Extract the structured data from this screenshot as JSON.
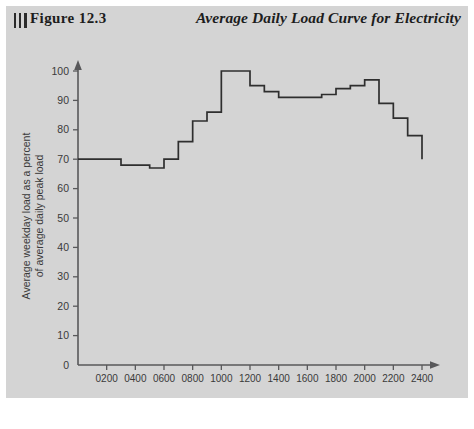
{
  "header": {
    "figure_label": "Figure 12.3",
    "title": "Average Daily Load Curve for Electricity",
    "bar_marks": "|||"
  },
  "colors": {
    "page_background": "#ffffff",
    "panel_background": "#d4d4d4",
    "axis": "#58585a",
    "curve": "#2e2e2e",
    "text": "#1d1d1d",
    "tick_text": "#3a3a3a"
  },
  "chart_data": {
    "type": "line",
    "title": "Average Daily Load Curve for Electricity",
    "subtitle": "",
    "xlabel": "Time of day",
    "ylabel": "Average weekday load as a percent of average daily peak load",
    "ylabel_line1": "Average weekday load as a percent",
    "ylabel_line2": "of average daily peak load",
    "xlim": [
      0,
      2400
    ],
    "ylim": [
      0,
      105
    ],
    "grid": false,
    "legend": "none",
    "step_style": "post",
    "ytick_labels": [
      "0",
      "10",
      "20",
      "30",
      "40",
      "50",
      "60",
      "70",
      "80",
      "90",
      "100"
    ],
    "yticks": [
      0,
      10,
      20,
      30,
      40,
      50,
      60,
      70,
      80,
      90,
      100
    ],
    "xtick_labels": [
      "0200",
      "0400",
      "0600",
      "0800",
      "1000",
      "1200",
      "1400",
      "1600",
      "1800",
      "2000",
      "2200",
      "2400"
    ],
    "xticks": [
      200,
      400,
      600,
      800,
      1000,
      1200,
      1400,
      1600,
      1800,
      2000,
      2200,
      2400
    ],
    "x": [
      0,
      200,
      300,
      400,
      500,
      600,
      700,
      800,
      900,
      1000,
      1100,
      1200,
      1300,
      1400,
      1500,
      1600,
      1700,
      1800,
      1900,
      2000,
      2100,
      2200,
      2300,
      2400
    ],
    "values": [
      70,
      70,
      68,
      68,
      67,
      70,
      76,
      83,
      86,
      100,
      100,
      95,
      93,
      91,
      91,
      91,
      92,
      94,
      95,
      97,
      89,
      84,
      78,
      78
    ],
    "end_value": 70,
    "series": [
      {
        "name": "Average weekday load",
        "points": [
          {
            "time": "0000",
            "value": 70
          },
          {
            "time": "0200",
            "value": 70
          },
          {
            "time": "0300",
            "value": 68
          },
          {
            "time": "0400",
            "value": 68
          },
          {
            "time": "0500",
            "value": 67
          },
          {
            "time": "0600",
            "value": 70
          },
          {
            "time": "0700",
            "value": 76
          },
          {
            "time": "0800",
            "value": 83
          },
          {
            "time": "0900",
            "value": 86
          },
          {
            "time": "1000",
            "value": 100
          },
          {
            "time": "1100",
            "value": 100
          },
          {
            "time": "1200",
            "value": 95
          },
          {
            "time": "1300",
            "value": 93
          },
          {
            "time": "1400",
            "value": 91
          },
          {
            "time": "1500",
            "value": 91
          },
          {
            "time": "1600",
            "value": 91
          },
          {
            "time": "1700",
            "value": 92
          },
          {
            "time": "1800",
            "value": 94
          },
          {
            "time": "1900",
            "value": 95
          },
          {
            "time": "2000",
            "value": 97
          },
          {
            "time": "2100",
            "value": 89
          },
          {
            "time": "2200",
            "value": 84
          },
          {
            "time": "2300",
            "value": 78
          },
          {
            "time": "2400",
            "value": 70
          }
        ]
      }
    ]
  }
}
